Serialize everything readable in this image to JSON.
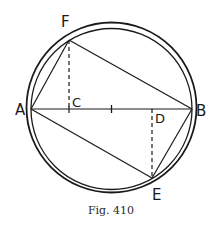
{
  "figure": {
    "caption": "Fig. 410",
    "colors": {
      "ink": "#1a1a1a",
      "background": "#ffffff"
    },
    "circles": {
      "outer": {
        "cx": 111.5,
        "cy": 107.5,
        "r": 85
      },
      "inner": {
        "cx": 111.5,
        "cy": 109,
        "r": 80.5
      }
    },
    "points": {
      "A": {
        "label": "A",
        "x": 31,
        "y": 109
      },
      "B": {
        "label": "B",
        "x": 192,
        "y": 109
      },
      "C": {
        "label": "C",
        "x": 69,
        "y": 109
      },
      "D": {
        "label": "D",
        "x": 152,
        "y": 109
      },
      "E": {
        "label": "E",
        "x": 152,
        "y": 178
      },
      "F": {
        "label": "F",
        "x": 69,
        "y": 40
      },
      "center_tick": {
        "x": 111.5,
        "y": 109
      }
    },
    "solid_segments": [
      "AB",
      "AF",
      "FB",
      "AE",
      "EB"
    ],
    "dashed_segments": [
      "FC",
      "ED"
    ]
  }
}
